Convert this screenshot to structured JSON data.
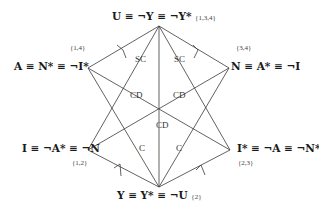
{
  "diagram": {
    "type": "hexagon-of-opposition",
    "nodes": {
      "top": {
        "label": "U ≡ ¬Y ≡ ¬Y*",
        "tag": "{1,3,4}"
      },
      "upper_left": {
        "label": "A ≡ N* ≡ ¬I*",
        "tag": "{1,4}"
      },
      "upper_right": {
        "label": "N ≡ A* ≡ ¬I",
        "tag": "{3,4}"
      },
      "lower_left": {
        "label": "I ≡ ¬A* ≡ ¬N",
        "tag": "{1,2}"
      },
      "lower_right": {
        "label": "I* ≡ ¬A ≡ ¬N*",
        "tag": "{2,3}"
      },
      "bottom": {
        "label": "Y ≡ Y* ≡ ¬U",
        "tag": "{2}"
      }
    },
    "edge_labels": {
      "sc_left": "SC",
      "sc_right": "SC",
      "cd_left": "CD",
      "cd_right": "CD",
      "cd_center": "CD",
      "c_left": "C",
      "c_right": "C"
    },
    "colors": {
      "line": "#3a3a3a",
      "text": "#1a1a1a"
    }
  }
}
